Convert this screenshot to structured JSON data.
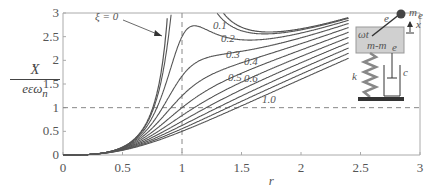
{
  "chart_data": {
    "type": "line",
    "title": "",
    "xlabel": "r",
    "ylabel": "Ẋ / (eεω_n)",
    "ylabel_parts": {
      "numerator": "X",
      "denominator": "eεω",
      "subscript": "n"
    },
    "xlim": [
      0,
      3
    ],
    "ylim": [
      0,
      3
    ],
    "x_ticks": [
      "0",
      "0.5",
      "1",
      "1.5",
      "2",
      "2.5",
      "3"
    ],
    "y_ticks": [
      "0",
      "0.5",
      "1",
      "1.5",
      "2",
      "2.5",
      "3"
    ],
    "grid": false,
    "reference_lines": [
      {
        "orientation": "horizontal",
        "value": 1,
        "style": "dashed"
      },
      {
        "orientation": "vertical",
        "value": 1,
        "style": "dashed"
      }
    ],
    "formula": "r^3 / sqrt((1 - r^2)^2 + (2*xi*r)^2)",
    "x_range_plotted": [
      0,
      2.4
    ],
    "series": [
      {
        "name": "ξ = 0",
        "xi": 0.0,
        "label": "ξ = 0"
      },
      {
        "name": "0.1",
        "xi": 0.1,
        "label": "0.1"
      },
      {
        "name": "0.2",
        "xi": 0.2,
        "label": "0.2"
      },
      {
        "name": "0.3",
        "xi": 0.3,
        "label": "0.3"
      },
      {
        "name": "0.4",
        "xi": 0.4,
        "label": "0.4"
      },
      {
        "name": "0.5",
        "xi": 0.5,
        "label": "0.5"
      },
      {
        "name": "0.6",
        "xi": 0.6,
        "label": "0.6"
      },
      {
        "name": "0.7",
        "xi": 0.7,
        "label": ""
      },
      {
        "name": "0.8",
        "xi": 0.8,
        "label": ""
      },
      {
        "name": "0.9",
        "xi": 0.9,
        "label": ""
      },
      {
        "name": "1.0",
        "xi": 1.0,
        "label": "1.0"
      }
    ],
    "sample_values": {
      "x": [
        0,
        0.5,
        0.8,
        1.0,
        1.5,
        2.0,
        2.4
      ],
      "xi_0.1": [
        0,
        0.166,
        1.37,
        5.0,
        2.69,
        2.66,
        2.89
      ],
      "xi_0.3": [
        0,
        0.161,
        0.866,
        1.667,
        2.23,
        2.48,
        2.77
      ],
      "xi_0.5": [
        0,
        0.152,
        0.582,
        1.0,
        1.79,
        2.22,
        2.59
      ],
      "xi_1.0": [
        0,
        0.1,
        0.311,
        0.5,
        1.04,
        1.6,
        2.04
      ]
    },
    "annotations": [
      "ξ = 0",
      "0.1",
      "0.2",
      "0.3",
      "0.4",
      "0.5",
      "0.6",
      "1.0"
    ]
  },
  "diagram": {
    "mass_label": "m-m",
    "mass_sub": "e",
    "eccentric_mass_label": "m",
    "eccentric_mass_sub": "e",
    "eccentricity_label": "e",
    "omega_label": "ωt",
    "displacement_label": "x",
    "spring_label": "k",
    "damper_label": "c"
  },
  "colors": {
    "curve": "#555555",
    "axis": "#aaaaaa",
    "dashed": "#888888",
    "mass_box": "#d0d0d0",
    "ground": "#333333"
  }
}
